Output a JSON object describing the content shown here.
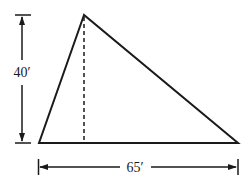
{
  "diagram": {
    "shape": "triangle",
    "height_label": "40′",
    "base_label": "65′",
    "stroke_color": "#1a1a1a",
    "background": "#ffffff"
  }
}
